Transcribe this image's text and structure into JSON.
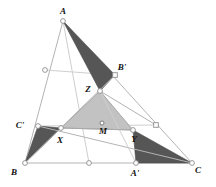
{
  "figure": {
    "colors": {
      "background": "#ffffff",
      "dark_fill": "#565656",
      "light_fill": "#c2c2c2",
      "line": "#b4b4b4",
      "faint_line": "#cfcfcf",
      "label": "#111111"
    },
    "labels": [
      {
        "id": "A",
        "text": "A",
        "x": 63,
        "y": 14
      },
      {
        "id": "Bp",
        "text": "B'",
        "x": 122,
        "y": 70
      },
      {
        "id": "Z",
        "text": "Z",
        "x": 88,
        "y": 92
      },
      {
        "id": "Cp",
        "text": "C'",
        "x": 20,
        "y": 128
      },
      {
        "id": "M",
        "text": "M",
        "x": 103,
        "y": 134
      },
      {
        "id": "X",
        "text": "X",
        "x": 60,
        "y": 143
      },
      {
        "id": "Y",
        "text": "Y",
        "x": 134,
        "y": 142
      },
      {
        "id": "B",
        "text": "B",
        "x": 14,
        "y": 175
      },
      {
        "id": "Ap",
        "text": "A'",
        "x": 135,
        "y": 176
      },
      {
        "id": "C",
        "text": "C",
        "x": 198,
        "y": 173
      }
    ],
    "points": [
      {
        "id": "A",
        "x": 63,
        "y": 21,
        "marker": "circle"
      },
      {
        "id": "B",
        "x": 25,
        "y": 163,
        "marker": "circle"
      },
      {
        "id": "C",
        "x": 192,
        "y": 163,
        "marker": "circle"
      },
      {
        "id": "Ap",
        "x": 136,
        "y": 163,
        "marker": "circle"
      },
      {
        "id": "Bp",
        "x": 115,
        "y": 75,
        "marker": "square"
      },
      {
        "id": "Cp",
        "x": 38,
        "y": 126,
        "marker": "circle"
      },
      {
        "id": "Ma",
        "x": 45,
        "y": 70,
        "marker": "circle"
      },
      {
        "id": "Mb",
        "x": 156,
        "y": 125,
        "marker": "square"
      },
      {
        "id": "Mc",
        "x": 89,
        "y": 163,
        "marker": "circle"
      },
      {
        "id": "X",
        "x": 61,
        "y": 128,
        "marker": "circle"
      },
      {
        "id": "Y",
        "x": 133,
        "y": 130,
        "marker": "circle"
      },
      {
        "id": "Z",
        "x": 100,
        "y": 91,
        "marker": "circle"
      },
      {
        "id": "M",
        "x": 102,
        "y": 123,
        "marker": "dot"
      }
    ],
    "segments": [
      {
        "id": "AB",
        "x1": 63,
        "y1": 21,
        "x2": 25,
        "y2": 163,
        "style": "seg"
      },
      {
        "id": "BC",
        "x1": 25,
        "y1": 163,
        "x2": 192,
        "y2": 163,
        "style": "seg"
      },
      {
        "id": "CA",
        "x1": 192,
        "y1": 163,
        "x2": 63,
        "y2": 21,
        "style": "seg"
      },
      {
        "id": "CpMb",
        "x1": 38,
        "y1": 126,
        "x2": 156,
        "y2": 125,
        "style": "seg-faint"
      },
      {
        "id": "MaBp",
        "x1": 45,
        "y1": 70,
        "x2": 115,
        "y2": 75,
        "style": "seg-faint"
      },
      {
        "id": "A-Mc",
        "x1": 63,
        "y1": 21,
        "x2": 89,
        "y2": 163,
        "style": "seg-faint"
      },
      {
        "id": "B-Bp",
        "x1": 25,
        "y1": 163,
        "x2": 115,
        "y2": 75,
        "style": "seg"
      },
      {
        "id": "C-Cp",
        "x1": 192,
        "y1": 163,
        "x2": 38,
        "y2": 126,
        "style": "seg"
      },
      {
        "id": "Ap-Z",
        "x1": 136,
        "y1": 163,
        "x2": 100,
        "y2": 91,
        "style": "seg-faint"
      },
      {
        "id": "Z-M-Mb",
        "x1": 100,
        "y1": 91,
        "x2": 156,
        "y2": 125,
        "style": "seg-inner"
      },
      {
        "id": "X-M",
        "x1": 61,
        "y1": 128,
        "x2": 133,
        "y2": 130,
        "style": "seg-inner"
      }
    ],
    "polygons": [
      {
        "id": "tri-A-Bp-Z",
        "kind": "dark",
        "pts": "63,21 115,75 100,91"
      },
      {
        "id": "tri-Cp-X-B",
        "kind": "dark",
        "pts": "38,126 61,128 25,163"
      },
      {
        "id": "tri-Y-Ap-C",
        "kind": "dark",
        "pts": "133,130 136,163 192,163"
      },
      {
        "id": "tri-XYZ",
        "kind": "light",
        "pts": "100,91 133,130 61,128"
      }
    ]
  }
}
